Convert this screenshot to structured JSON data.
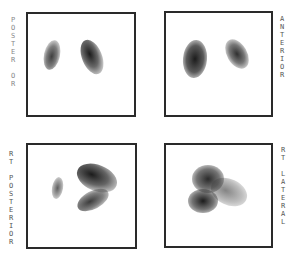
{
  "panels": [
    {
      "id": "posterior",
      "label": "POSTERIOR",
      "label_side": "left",
      "box": {
        "x": 26,
        "y": 12,
        "w": 110,
        "h": 105
      }
    },
    {
      "id": "anterior",
      "label": "ANTERIOR",
      "label_side": "right",
      "box": {
        "x": 164,
        "y": 11,
        "w": 109,
        "h": 106
      }
    },
    {
      "id": "rt-posterior",
      "label": "RT POSTERIOR",
      "label_side": "left",
      "box": {
        "x": 26,
        "y": 143,
        "w": 111,
        "h": 106
      }
    },
    {
      "id": "rt-lateral",
      "label": "RT LATERAL",
      "label_side": "right",
      "box": {
        "x": 164,
        "y": 143,
        "w": 109,
        "h": 105
      }
    }
  ],
  "labels": {
    "posterior": [
      "P",
      "O",
      "S",
      "T",
      "E",
      "R",
      "",
      "O",
      "R"
    ],
    "anterior": [
      "A",
      "N",
      "T",
      "E",
      "R",
      "I",
      "O",
      "R"
    ],
    "rt_posterior": [
      "R",
      "T",
      "",
      "P",
      "O",
      "S",
      "T",
      "E",
      "R",
      "I",
      "O",
      "R"
    ],
    "rt_lateral": [
      "R",
      "T",
      "",
      "L",
      "A",
      "T",
      "E",
      "R",
      "A",
      "L"
    ]
  },
  "colors": {
    "frame": "#2a2a2a",
    "uptake": "#1e1e1e",
    "label": "#555555",
    "background": "#ffffff"
  }
}
